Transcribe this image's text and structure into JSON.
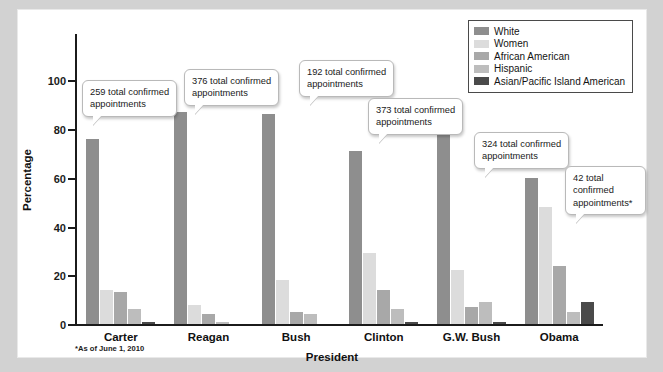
{
  "chart_data": {
    "type": "bar",
    "title": "",
    "xlabel": "President",
    "ylabel": "Percentage",
    "ylim": [
      0,
      110
    ],
    "yticks": [
      0,
      20,
      40,
      60,
      80,
      100
    ],
    "ytick_labels": [
      "0",
      "20",
      "40",
      "60",
      "80",
      "100"
    ],
    "grid": false,
    "legend_position": "top-right",
    "categories": [
      "Carter",
      "Reagan",
      "Bush",
      "Clinton",
      "G.W. Bush",
      "Obama"
    ],
    "series": [
      {
        "name": "White",
        "color": "#8e8e8e",
        "values": [
          76,
          87,
          86,
          71,
          80,
          60
        ]
      },
      {
        "name": "Women",
        "color": "#dcdcdc",
        "values": [
          14,
          8,
          18,
          29,
          22,
          48
        ]
      },
      {
        "name": "African American",
        "color": "#a8a8a8",
        "values": [
          13,
          4,
          5,
          14,
          7,
          24
        ]
      },
      {
        "name": "Hispanic",
        "color": "#bdbdbd",
        "values": [
          6,
          1,
          4,
          6,
          9,
          5
        ]
      },
      {
        "name": "Asian/Pacific Island American",
        "color": "#4a4a4a",
        "values": [
          1,
          0,
          0,
          1,
          1,
          9
        ]
      }
    ],
    "annotations": [
      {
        "category": "Carter",
        "text": "259 total confirmed\nappointments"
      },
      {
        "category": "Reagan",
        "text": "376 total confirmed\nappointments"
      },
      {
        "category": "Bush",
        "text": "192 total confirmed\nappointments"
      },
      {
        "category": "Clinton",
        "text": "373 total confirmed\nappointments"
      },
      {
        "category": "G.W. Bush",
        "text": "324 total confirmed\nappointments"
      },
      {
        "category": "Obama",
        "text": "42 total confirmed\nappointments*"
      }
    ],
    "footnote": "*As of June 1, 2010"
  },
  "legend": {
    "items": [
      {
        "label": "White",
        "color": "#8e8e8e"
      },
      {
        "label": "Women",
        "color": "#dcdcdc"
      },
      {
        "label": "African American",
        "color": "#a8a8a8"
      },
      {
        "label": "Hispanic",
        "color": "#bdbdbd"
      },
      {
        "label": "Asian/Pacific Island American",
        "color": "#4a4a4a"
      }
    ]
  },
  "colors": {
    "page_background": "#d2d2d2",
    "figure_background": "#ffffff",
    "axis": "#1b1b1b",
    "callout_border": "#b9b9b9"
  }
}
